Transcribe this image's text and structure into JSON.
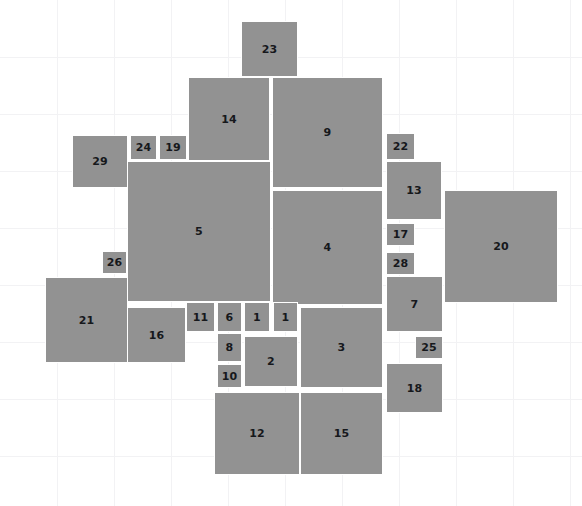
{
  "canvas": {
    "width": 582,
    "height": 506,
    "background_color": "#ffffff",
    "grid_color": "#f2f2f4",
    "grid_spacing": 57,
    "rect_fill_color": "#929292",
    "rect_border_color": "#ffffff",
    "label_color": "#16181c"
  },
  "chart_data": {
    "type": "treemap",
    "title": "",
    "xlabel": "",
    "ylabel": "",
    "grid": true,
    "legend": "none",
    "xlim": [
      0,
      582
    ],
    "ylim": [
      0,
      506
    ],
    "note": "Rectangle packing / bin-packing layout; each rectangle is labeled with its item number.",
    "items": [
      {
        "label": "23",
        "x": 241,
        "y": 21,
        "w": 57,
        "h": 56
      },
      {
        "label": "14",
        "x": 188,
        "y": 77,
        "w": 82,
        "h": 84
      },
      {
        "label": "9",
        "x": 272,
        "y": 77,
        "w": 111,
        "h": 111
      },
      {
        "label": "29",
        "x": 72,
        "y": 135,
        "w": 56,
        "h": 53
      },
      {
        "label": "24",
        "x": 130,
        "y": 135,
        "w": 27,
        "h": 25
      },
      {
        "label": "19",
        "x": 159,
        "y": 135,
        "w": 28,
        "h": 25
      },
      {
        "label": "22",
        "x": 386,
        "y": 133,
        "w": 29,
        "h": 27
      },
      {
        "label": "13",
        "x": 386,
        "y": 161,
        "w": 56,
        "h": 59
      },
      {
        "label": "5",
        "x": 127,
        "y": 161,
        "w": 144,
        "h": 141
      },
      {
        "label": "4",
        "x": 272,
        "y": 190,
        "w": 111,
        "h": 115
      },
      {
        "label": "20",
        "x": 444,
        "y": 190,
        "w": 114,
        "h": 113
      },
      {
        "label": "17",
        "x": 386,
        "y": 223,
        "w": 29,
        "h": 23
      },
      {
        "label": "28",
        "x": 386,
        "y": 252,
        "w": 29,
        "h": 23
      },
      {
        "label": "26",
        "x": 102,
        "y": 251,
        "w": 25,
        "h": 23
      },
      {
        "label": "7",
        "x": 386,
        "y": 276,
        "w": 57,
        "h": 56
      },
      {
        "label": "21",
        "x": 45,
        "y": 277,
        "w": 83,
        "h": 86
      },
      {
        "label": "11",
        "x": 186,
        "y": 302,
        "w": 29,
        "h": 30
      },
      {
        "label": "6",
        "x": 217,
        "y": 302,
        "w": 25,
        "h": 30
      },
      {
        "label": "1",
        "x": 244,
        "y": 302,
        "w": 26,
        "h": 30
      },
      {
        "label": "1",
        "x": 273,
        "y": 302,
        "w": 25,
        "h": 30
      },
      {
        "label": "3",
        "x": 300,
        "y": 307,
        "w": 83,
        "h": 81
      },
      {
        "label": "16",
        "x": 127,
        "y": 307,
        "w": 59,
        "h": 56
      },
      {
        "label": "8",
        "x": 217,
        "y": 333,
        "w": 25,
        "h": 29
      },
      {
        "label": "2",
        "x": 244,
        "y": 336,
        "w": 54,
        "h": 51
      },
      {
        "label": "25",
        "x": 415,
        "y": 336,
        "w": 28,
        "h": 23
      },
      {
        "label": "10",
        "x": 217,
        "y": 364,
        "w": 25,
        "h": 24
      },
      {
        "label": "18",
        "x": 386,
        "y": 363,
        "w": 57,
        "h": 50
      },
      {
        "label": "12",
        "x": 214,
        "y": 392,
        "w": 86,
        "h": 83
      },
      {
        "label": "15",
        "x": 300,
        "y": 392,
        "w": 83,
        "h": 83
      }
    ]
  }
}
